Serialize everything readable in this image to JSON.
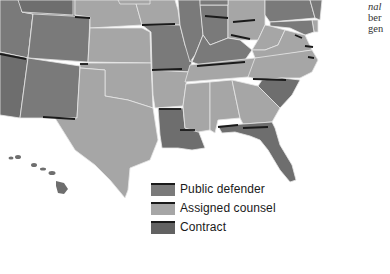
{
  "map": {
    "title": "",
    "colors": {
      "public_defender": "#7a7a7a",
      "assigned_counsel": "#a6a6a6",
      "contract": "#626262",
      "border": "#e6e6e6",
      "shadow": "#1a1a1a"
    }
  },
  "legend": {
    "items": [
      {
        "label": "Public defender",
        "color": "#7a7a7a"
      },
      {
        "label": "Assigned counsel",
        "color": "#a6a6a6"
      },
      {
        "label": "Contract",
        "color": "#626262"
      }
    ]
  },
  "side_text": {
    "lines": [
      "nal",
      "ber",
      "gen"
    ]
  }
}
